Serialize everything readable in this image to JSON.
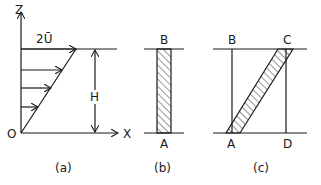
{
  "panels": {
    "a": {
      "caption": "(a)",
      "axis_z": "Z",
      "axis_x": "X",
      "origin": "O",
      "velocity_label": "2Ū",
      "height_label": "H"
    },
    "b": {
      "caption": "(b)",
      "top_label": "B",
      "bottom_label": "A"
    },
    "c": {
      "caption": "(c)",
      "top_left_label": "B",
      "top_right_label": "C",
      "bottom_left_label": "A",
      "bottom_right_label": "D"
    }
  },
  "colors": {
    "ink": "#1a1a1a",
    "background": "#ffffff"
  }
}
